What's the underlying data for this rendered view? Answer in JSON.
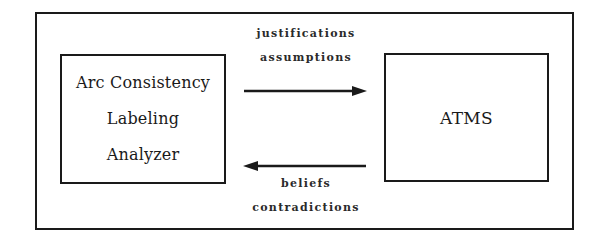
{
  "diagram": {
    "type": "block-diagram",
    "left_box": {
      "lines": [
        "Arc Consistency",
        "Labeling",
        "Analyzer"
      ]
    },
    "right_box": {
      "lines": [
        "ATMS"
      ]
    },
    "top_arrow": {
      "direction": "left-to-right",
      "from": "Arc Consistency Labeling Analyzer",
      "to": "ATMS",
      "labels": [
        "justifications",
        "assumptions"
      ]
    },
    "bottom_arrow": {
      "direction": "right-to-left",
      "from": "ATMS",
      "to": "Arc Consistency Labeling Analyzer",
      "labels": [
        "beliefs",
        "contradictions"
      ]
    },
    "colors": {
      "line": "#1a1a1a",
      "background": "#ffffff"
    }
  }
}
